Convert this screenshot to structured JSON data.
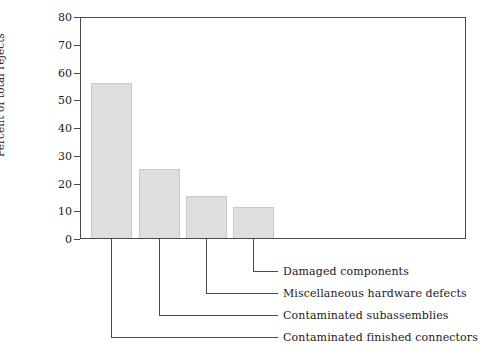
{
  "chart_data": {
    "type": "bar",
    "title": "",
    "subtitle": "",
    "xlabel": "",
    "ylabel": "Percent of total rejects",
    "ylim": [
      0,
      80
    ],
    "yticks": [
      0,
      10,
      20,
      30,
      40,
      50,
      60,
      70,
      80
    ],
    "ytick_labels": [
      "0",
      "10",
      "20",
      "30",
      "40",
      "50",
      "60",
      "70",
      "80"
    ],
    "grid": false,
    "legend": false,
    "legend_position": "none",
    "categories": [
      "Contaminated finished connectors",
      "Contaminated subassemblies",
      "Miscellaneous hardware defects",
      "Damaged components"
    ],
    "values": [
      56,
      25,
      15,
      11
    ],
    "bar_color": "#dedede",
    "bar_border_color": "#c9c9c9",
    "axis_color": "#4a4a4a",
    "text_color": "#1a1a1a",
    "annotations": [
      {
        "label": "Damaged components",
        "bar_index": 3
      },
      {
        "label": "Miscellaneous hardware defects",
        "bar_index": 2
      },
      {
        "label": "Contaminated subassemblies",
        "bar_index": 1
      },
      {
        "label": "Contaminated finished connectors",
        "bar_index": 0
      }
    ]
  }
}
